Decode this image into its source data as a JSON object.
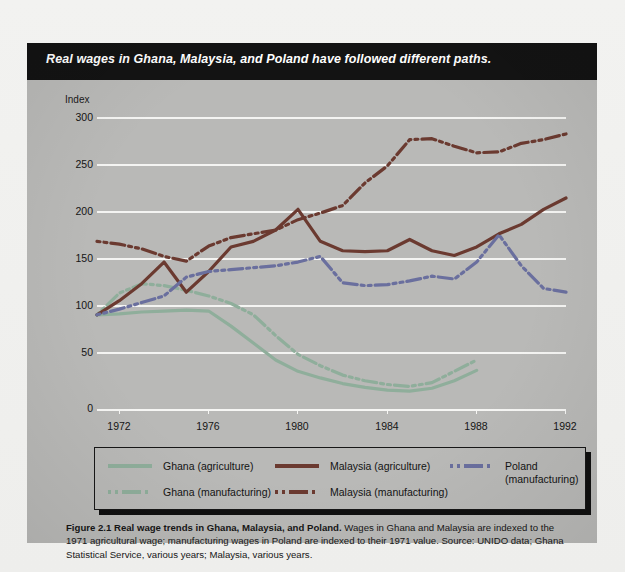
{
  "banner": {
    "title": "Real wages in Ghana, Malaysia, and Poland have followed different paths."
  },
  "caption": {
    "figure_label": "Figure 2.1  Real wage trends in Ghana, Malaysia, and Poland.",
    "body": " Wages in Ghana and Malaysia are indexed to the 1971 agricultural wage; manufacturing wages in Poland are indexed to their 1971 value.  Source: UNIDO data; Ghana Statistical Service, various years; Malaysia, various years."
  },
  "colors": {
    "plot_background": "#b9b9b7",
    "banner_background": "#131313",
    "gridline": "#f4f4f2",
    "ghana": "#8fae9b",
    "malaysia": "#6b3a30",
    "poland": "#6a6f9e"
  },
  "chart_data": {
    "type": "line",
    "title": "Real wages in Ghana, Malaysia, and Poland have followed different paths.",
    "xlabel": "",
    "ylabel": "Index",
    "xlim": [
      1971,
      1992
    ],
    "ylim": [
      0,
      310
    ],
    "yticks": [
      0,
      50,
      100,
      150,
      200,
      250,
      300
    ],
    "xticks": [
      1972,
      1976,
      1980,
      1984,
      1988,
      1992
    ],
    "grid": true,
    "legend_position": "below-plot",
    "x": [
      1971,
      1972,
      1973,
      1974,
      1975,
      1976,
      1977,
      1978,
      1979,
      1980,
      1981,
      1982,
      1983,
      1984,
      1985,
      1986,
      1987,
      1988,
      1989,
      1990,
      1991,
      1992
    ],
    "series": [
      {
        "name": "Ghana (agriculture)",
        "color": "#8fae9b",
        "style": "solid",
        "values": [
          100,
          101,
          103,
          104,
          105,
          104,
          88,
          70,
          52,
          40,
          33,
          27,
          23,
          20,
          19,
          22,
          30,
          41,
          null,
          null,
          null,
          null
        ]
      },
      {
        "name": "Ghana (manufacturing)",
        "color": "#8fae9b",
        "style": "dash-dot",
        "values": [
          100,
          123,
          133,
          131,
          126,
          120,
          112,
          100,
          78,
          58,
          46,
          36,
          30,
          26,
          24,
          28,
          40,
          52,
          null,
          null,
          null,
          null
        ]
      },
      {
        "name": "Malaysia (agriculture)",
        "color": "#6b3a30",
        "style": "solid",
        "values": [
          100,
          115,
          133,
          156,
          124,
          146,
          172,
          178,
          190,
          212,
          178,
          168,
          167,
          168,
          180,
          168,
          163,
          172,
          186,
          196,
          212,
          224
        ]
      },
      {
        "name": "Malaysia (manufacturing)",
        "color": "#6b3a30",
        "style": "dash-dot",
        "values": [
          178,
          175,
          170,
          162,
          157,
          173,
          182,
          186,
          190,
          201,
          208,
          216,
          240,
          258,
          286,
          287,
          279,
          272,
          273,
          282,
          286,
          292
        ]
      },
      {
        "name": "Poland (manufacturing)",
        "color": "#6a6f9e",
        "style": "dash-dot",
        "values": [
          100,
          106,
          113,
          120,
          140,
          146,
          148,
          150,
          152,
          156,
          162,
          134,
          131,
          132,
          136,
          141,
          138,
          156,
          185,
          152,
          128,
          124
        ]
      }
    ]
  },
  "axis": {
    "y_title": "Index",
    "ytick_labels": [
      "300",
      "250",
      "200",
      "150",
      "100",
      "50",
      "0"
    ],
    "xtick_labels": [
      "1972",
      "1976",
      "1980",
      "1984",
      "1988",
      "1992"
    ]
  },
  "legend": {
    "entries": [
      {
        "label": "Ghana (agriculture)",
        "color": "#8fae9b",
        "style": "solid"
      },
      {
        "label": "Malaysia (agriculture)",
        "color": "#6b3a30",
        "style": "solid"
      },
      {
        "label": "Poland\n(manufacturing)",
        "color": "#6a6f9e",
        "style": "dash-dot"
      },
      {
        "label": "Ghana (manufacturing)",
        "color": "#8fae9b",
        "style": "dash-dot"
      },
      {
        "label": "Malaysia (manufacturing)",
        "color": "#6b3a30",
        "style": "dash-dot"
      }
    ]
  }
}
